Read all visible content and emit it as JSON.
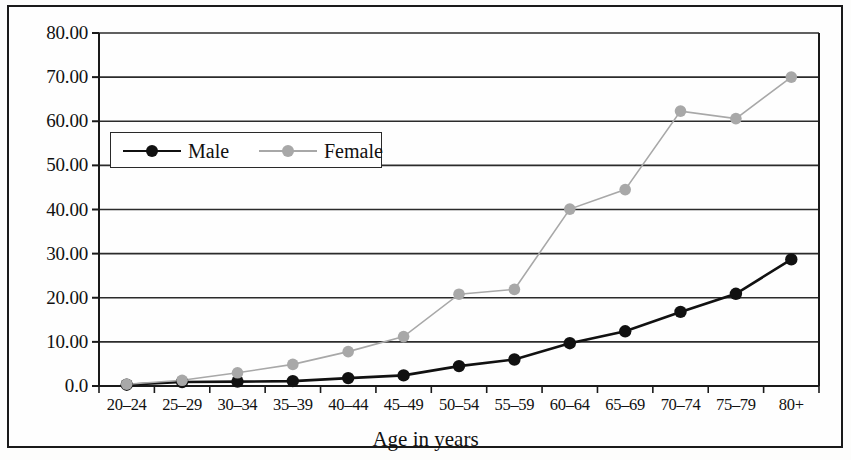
{
  "chart_data": {
    "type": "line",
    "title": "",
    "xlabel": "Age in years",
    "ylabel": "",
    "categories": [
      "20–24",
      "25–29",
      "30–34",
      "35–39",
      "40–44",
      "45–49",
      "50–54",
      "55–59",
      "60–64",
      "65–69",
      "70–74",
      "75–79",
      "80+"
    ],
    "series": [
      {
        "name": "Male",
        "color": "#111111",
        "marker": "filled-circle",
        "values": [
          0.3,
          0.9,
          1.0,
          1.1,
          1.8,
          2.4,
          4.5,
          6.0,
          9.7,
          12.4,
          16.8,
          20.9,
          28.7
        ]
      },
      {
        "name": "Female",
        "color": "#a8a8a8",
        "marker": "filled-circle",
        "values": [
          0.4,
          1.3,
          3.0,
          4.9,
          7.8,
          11.2,
          20.8,
          21.9,
          40.1,
          44.5,
          62.3,
          60.6,
          70.0
        ]
      }
    ],
    "ylim": [
      0,
      80
    ],
    "ytick_values": [
      0,
      10,
      20,
      30,
      40,
      50,
      60,
      70,
      80
    ],
    "ytick_labels": [
      "0.0",
      "10.00",
      "20.00",
      "30.00",
      "40.00",
      "50.00",
      "60.00",
      "70.00",
      "80.00"
    ],
    "grid": "horizontal",
    "legend_position": "upper-left-inside",
    "legend_entries": [
      "Male",
      "Female"
    ]
  },
  "axis": {
    "x_title": "Age in years"
  }
}
